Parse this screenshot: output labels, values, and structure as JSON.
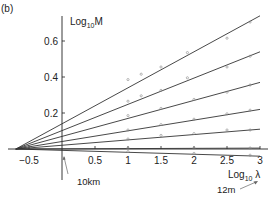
{
  "panel_label": "(b)",
  "chart_data": {
    "type": "line",
    "title": "",
    "panel": "(b)",
    "xlabel": "Log10 λ",
    "ylabel": "Log10 M",
    "xlim": [
      -0.82,
      3.1
    ],
    "ylim": [
      -0.08,
      0.75
    ],
    "x_ticks": [
      -0.5,
      0.5,
      1,
      1.5,
      2,
      2.5,
      3
    ],
    "x_tick_labels": [
      "−0.5",
      "0.5",
      "1",
      "1.5",
      "2",
      "2.5",
      "3"
    ],
    "y_ticks": [
      0.2,
      0.4,
      0.6
    ],
    "y_tick_labels": [
      "0.2",
      "0.4",
      "0.6"
    ],
    "grid": false,
    "legend": "none",
    "convergence_point": {
      "x": -0.7,
      "y": 0.0
    },
    "series": [
      {
        "name": "line1",
        "x": [
          -0.7,
          3.0
        ],
        "y": [
          0.0,
          0.74
        ],
        "points": [
          [
            1.0,
            0.38
          ],
          [
            1.2,
            0.41
          ],
          [
            1.5,
            0.45
          ],
          [
            1.9,
            0.53
          ],
          [
            2.5,
            0.61
          ],
          [
            2.85,
            0.7
          ]
        ]
      },
      {
        "name": "line2",
        "x": [
          -0.7,
          3.0
        ],
        "y": [
          0.0,
          0.54
        ],
        "points": [
          [
            1.0,
            0.26
          ],
          [
            1.2,
            0.29
          ],
          [
            1.5,
            0.32
          ],
          [
            1.9,
            0.39
          ],
          [
            2.5,
            0.45
          ],
          [
            2.85,
            0.51
          ]
        ]
      },
      {
        "name": "line3",
        "x": [
          -0.7,
          3.0
        ],
        "y": [
          0.0,
          0.37
        ],
        "points": [
          [
            1.0,
            0.18
          ],
          [
            1.5,
            0.22
          ],
          [
            2.0,
            0.27
          ],
          [
            2.5,
            0.31
          ],
          [
            2.85,
            0.35
          ]
        ]
      },
      {
        "name": "line4",
        "x": [
          -0.7,
          3.0
        ],
        "y": [
          0.0,
          0.22
        ],
        "points": [
          [
            1.0,
            0.1
          ],
          [
            1.5,
            0.13
          ],
          [
            2.0,
            0.16
          ],
          [
            2.5,
            0.19
          ],
          [
            2.85,
            0.21
          ]
        ]
      },
      {
        "name": "line5",
        "x": [
          -0.7,
          3.0
        ],
        "y": [
          0.0,
          0.11
        ],
        "points": [
          [
            1.0,
            0.05
          ],
          [
            1.5,
            0.07
          ],
          [
            2.0,
            0.08
          ],
          [
            2.5,
            0.1
          ],
          [
            2.85,
            0.1
          ]
        ]
      },
      {
        "name": "line6",
        "x": [
          -0.7,
          3.0
        ],
        "y": [
          0.0,
          0.005
        ],
        "points": [
          [
            1.0,
            0.0
          ],
          [
            2.0,
            0.0
          ],
          [
            2.85,
            0.0
          ]
        ]
      },
      {
        "name": "line7",
        "x": [
          -0.7,
          3.0
        ],
        "y": [
          0.0,
          -0.04
        ],
        "points": [
          [
            1.0,
            -0.02
          ],
          [
            2.0,
            -0.03
          ],
          [
            2.85,
            -0.04
          ]
        ]
      }
    ],
    "annotations": [
      {
        "text": "10km",
        "arrow_to": {
          "x": 0.0,
          "y": -0.02
        }
      },
      {
        "text": "12m",
        "arrow_to": {
          "x": 3.0,
          "y": -0.06
        }
      }
    ]
  },
  "labels": {
    "ylabel_main": "Log",
    "ylabel_sub": "10",
    "ylabel_var": "M",
    "xlabel_main": "Log",
    "xlabel_sub": "10",
    "xlabel_var": " λ",
    "annot_10km": "10km",
    "annot_12m": "12m"
  },
  "colors": {
    "line": "#333333",
    "axis": "#222222",
    "marker": "#888888",
    "text": "#222222"
  }
}
